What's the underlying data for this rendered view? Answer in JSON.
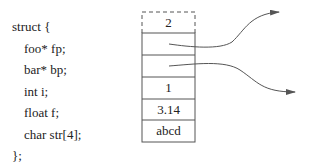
{
  "code": {
    "open": "struct {",
    "fields": [
      "foo* fp;",
      "bar* bp;",
      "int i;",
      "float f;",
      "char str[4];"
    ],
    "close": "};"
  },
  "memory": {
    "cells": [
      {
        "value": "2",
        "style": "dashed"
      },
      {
        "value": "",
        "style": "solid",
        "pointer": true
      },
      {
        "value": "",
        "style": "solid",
        "pointer": true
      },
      {
        "value": "1",
        "style": "solid"
      },
      {
        "value": "3.14",
        "style": "solid"
      },
      {
        "value": "abcd",
        "style": "solid"
      }
    ]
  },
  "colors": {
    "line": "#555555",
    "text": "#222222"
  }
}
